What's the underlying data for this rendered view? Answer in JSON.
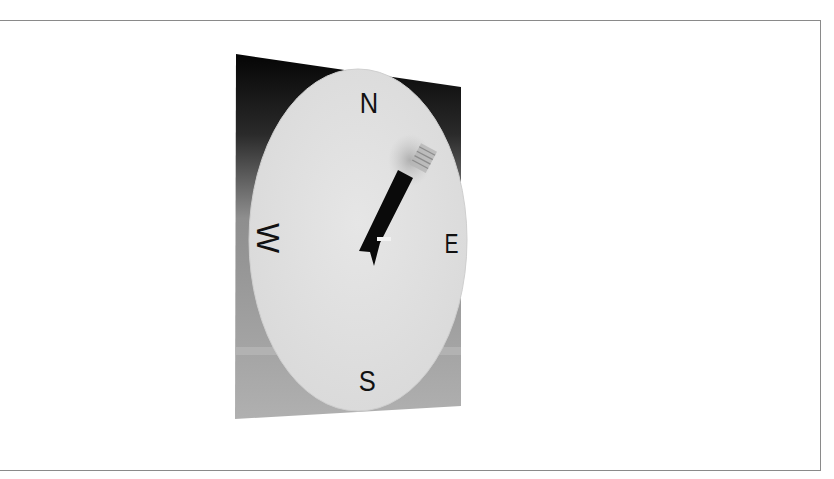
{
  "figure": {
    "type": "compass-illustration",
    "labels": {
      "north": "N",
      "east": "E",
      "south": "S",
      "west": "W"
    },
    "needle": {
      "direction": "NE",
      "angle_deg": 28
    },
    "colors": {
      "background": "#ffffff",
      "frame_border": "#8a8a8a",
      "panel_top": "#0c0c0c",
      "panel_bottom": "#a9a9a9",
      "dial_face": "#e2e2e2",
      "needle": "#0a0a0a",
      "label": "#111111"
    }
  }
}
